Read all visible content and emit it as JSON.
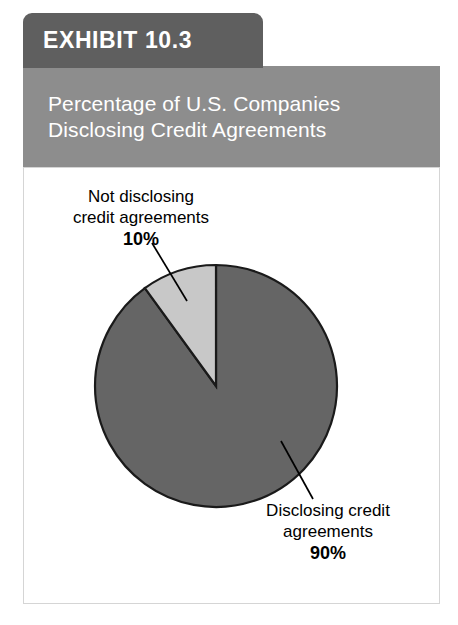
{
  "exhibit": {
    "tab_label": "EXHIBIT 10.3",
    "title_line_1": "Percentage of U.S. Companies",
    "title_line_2": "Disclosing Credit Agreements"
  },
  "colors": {
    "tab_background": "#5f5f5f",
    "banner_background": "#8d8d8d",
    "card_background": "#ffffff",
    "card_border": "#d5d5d5",
    "slice_disclosing": "#656565",
    "slice_not_disclosing": "#c8c8c8",
    "slice_outline": "#1a1a1a",
    "leader_line": "#000000",
    "label_text": "#000000",
    "title_text": "#ffffff"
  },
  "callouts": {
    "not_disclosing": {
      "line_1": "Not disclosing",
      "line_2": "credit agreements",
      "value_label": "10%"
    },
    "disclosing": {
      "line_1": "Disclosing credit",
      "line_2": "agreements",
      "value_label": "90%"
    }
  },
  "chart_data": {
    "type": "pie",
    "title": "Percentage of U.S. Companies Disclosing Credit Agreements",
    "subtitle": "",
    "xlabel": "",
    "ylabel": "",
    "categories": [
      "Disclosing credit agreements",
      "Not disclosing credit agreements"
    ],
    "values": [
      90,
      10
    ],
    "value_labels": [
      "90%",
      "10%"
    ],
    "units": "percent",
    "total": 100,
    "slices": [
      {
        "name": "Disclosing credit agreements",
        "value": 90,
        "label": "90%",
        "color": "#656565",
        "start_angle_deg": 0,
        "end_angle_deg": 324
      },
      {
        "name": "Not disclosing credit agreements",
        "value": 10,
        "label": "10%",
        "color": "#c8c8c8",
        "start_angle_deg": 324,
        "end_angle_deg": 360
      }
    ],
    "legend": "none",
    "legend_position": "callout-labels",
    "grid": false,
    "start_angle_note": "first slice begins at 12 o'clock, drawn clockwise"
  }
}
